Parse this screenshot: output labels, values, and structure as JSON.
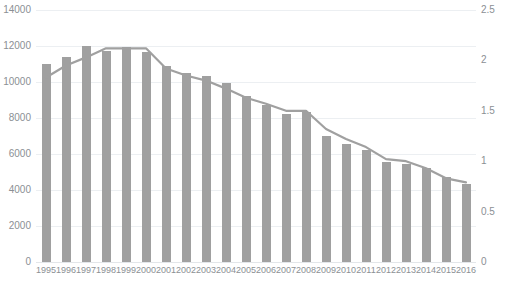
{
  "chart_data": {
    "type": "bar",
    "title": "",
    "subtitle": "",
    "xlabel": "",
    "ylabel": "",
    "y2label": "",
    "grid": true,
    "legend_position": "none",
    "categories": [
      "1995",
      "1996",
      "1997",
      "1998",
      "1999",
      "2000",
      "2001",
      "2002",
      "2003",
      "2004",
      "2005",
      "2006",
      "2007",
      "2008",
      "2009",
      "2010",
      "2011",
      "2012",
      "2013",
      "2014",
      "2015",
      "2016"
    ],
    "ylim": [
      0,
      14000
    ],
    "yticks": [
      0,
      2000,
      4000,
      6000,
      8000,
      10000,
      12000,
      14000
    ],
    "ytick_labels": [
      "0",
      "2000",
      "4000",
      "6000",
      "8000",
      "10000",
      "12000",
      "14000"
    ],
    "y2lim": [
      0,
      2.5
    ],
    "y2ticks": [
      0,
      0.5,
      1,
      1.5,
      2,
      2.5
    ],
    "y2tick_labels": [
      "0",
      "0.5",
      "1",
      "1.5",
      "2",
      "2.5"
    ],
    "series": [
      {
        "name": "bars",
        "type": "bar",
        "axis": "left",
        "color": "#a0a0a0",
        "values": [
          11000,
          11400,
          12000,
          11700,
          11950,
          11650,
          10900,
          10500,
          10350,
          9950,
          9250,
          8700,
          8250,
          8350,
          7000,
          6550,
          6200,
          5550,
          5450,
          5200,
          4700,
          4350
        ]
      },
      {
        "name": "line",
        "type": "line",
        "axis": "right",
        "color": "#a0a0a0",
        "values": [
          1.83,
          1.95,
          2.03,
          2.12,
          2.12,
          2.12,
          1.92,
          1.85,
          1.8,
          1.72,
          1.63,
          1.57,
          1.5,
          1.5,
          1.32,
          1.22,
          1.14,
          1.02,
          1.0,
          0.93,
          0.83,
          0.79
        ]
      }
    ]
  }
}
